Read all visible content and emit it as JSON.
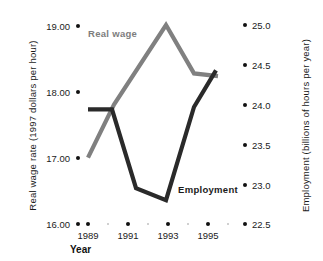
{
  "chart_data": {
    "type": "line",
    "title": "",
    "xlabel": "Year",
    "x_tick_labels": [
      "1989",
      "1991",
      "1993",
      "1995"
    ],
    "x_ticks_major": [
      1989,
      1991,
      1993,
      1995
    ],
    "x_ticks_minor": [
      1990,
      1992,
      1994
    ],
    "xlim": [
      1988.2,
      1995.8
    ],
    "grid": false,
    "legend_position": "inline-annotations",
    "axes": [
      {
        "id": "left",
        "label": "Real wage rate (1997 dollars per hour)",
        "tick_labels": [
          "19.00",
          "18.00",
          "17.00",
          "16.00"
        ],
        "ticks": [
          19.0,
          18.0,
          17.0,
          16.0
        ],
        "ylim": [
          16.0,
          19.0
        ],
        "color": "#808080"
      },
      {
        "id": "right",
        "label": "Employment (billions of hours per year)",
        "tick_labels": [
          "25.0",
          "24.5",
          "24.0",
          "23.5",
          "23.0",
          "22.5"
        ],
        "ticks": [
          25.0,
          24.5,
          24.0,
          23.5,
          23.0,
          22.5
        ],
        "ylim": [
          22.5,
          25.0
        ],
        "color": "#2a2a2a"
      }
    ],
    "series": [
      {
        "name": "Real wage",
        "axis": "left",
        "color": "#808080",
        "x": [
          1989.0,
          1990.3,
          1992.9,
          1994.3,
          1995.5
        ],
        "values": [
          17.0,
          17.8,
          19.0,
          18.27,
          18.23
        ]
      },
      {
        "name": "Employment",
        "axis": "right",
        "color": "#2a2a2a",
        "x": [
          1989.0,
          1990.2,
          1991.4,
          1992.9,
          1994.3,
          1995.4
        ],
        "values": [
          23.94,
          23.94,
          22.95,
          22.8,
          23.97,
          24.43
        ]
      }
    ],
    "annotations": [
      {
        "text": "Real wage",
        "series": "Real wage",
        "color": "#7d7d7d"
      },
      {
        "text": "Employment",
        "series": "Employment",
        "color": "#1b1b1b"
      }
    ]
  },
  "left_axis": {
    "title": "Real wage rate (1997 dollars per hour)",
    "ticks": [
      {
        "label": "19.00"
      },
      {
        "label": "18.00"
      },
      {
        "label": "17.00"
      },
      {
        "label": "16.00"
      }
    ]
  },
  "right_axis": {
    "title": "Employment (billions of hours per year)",
    "ticks": [
      {
        "label": "25.0"
      },
      {
        "label": "24.5"
      },
      {
        "label": "24.0"
      },
      {
        "label": "23.5"
      },
      {
        "label": "23.0"
      },
      {
        "label": "22.5"
      }
    ]
  },
  "x_axis": {
    "title": "Year",
    "ticks": [
      {
        "label": "1989"
      },
      {
        "label": "1991"
      },
      {
        "label": "1993"
      },
      {
        "label": "1995"
      }
    ]
  },
  "series_labels": {
    "real_wage": "Real wage",
    "employment": "Employment"
  },
  "colors": {
    "real_wage": "#808080",
    "employment": "#2a2a2a",
    "tick_dot": "#111111",
    "minor_dot": "#c0c0c0",
    "background": "#ffffff"
  }
}
